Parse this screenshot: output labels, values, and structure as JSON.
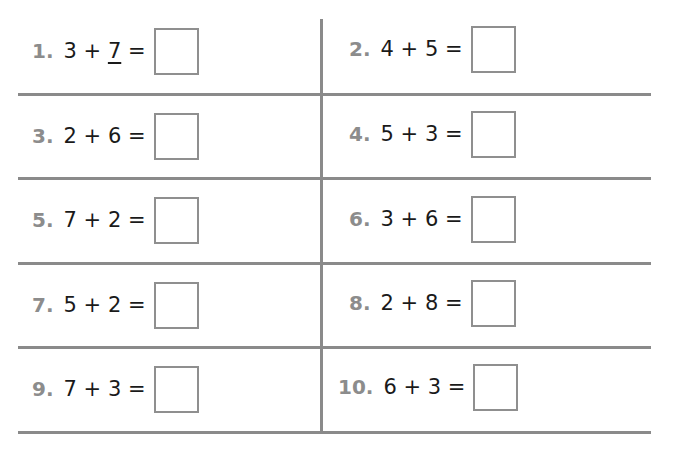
{
  "worksheet": {
    "problems": [
      {
        "number": "1.",
        "a": "3",
        "op": "+",
        "b": "7",
        "eq": "=",
        "b_underlined": true,
        "answer": ""
      },
      {
        "number": "2.",
        "a": "4",
        "op": "+",
        "b": "5",
        "eq": "=",
        "answer": ""
      },
      {
        "number": "3.",
        "a": "2",
        "op": "+",
        "b": "6",
        "eq": "=",
        "answer": ""
      },
      {
        "number": "4.",
        "a": "5",
        "op": "+",
        "b": "3",
        "eq": "=",
        "answer": ""
      },
      {
        "number": "5.",
        "a": "7",
        "op": "+",
        "b": "2",
        "eq": "=",
        "answer": ""
      },
      {
        "number": "6.",
        "a": "3",
        "op": "+",
        "b": "6",
        "eq": "=",
        "answer": ""
      },
      {
        "number": "7.",
        "a": "5",
        "op": "+",
        "b": "2",
        "eq": "=",
        "answer": ""
      },
      {
        "number": "8.",
        "a": "2",
        "op": "+",
        "b": "8",
        "eq": "=",
        "answer": ""
      },
      {
        "number": "9.",
        "a": "7",
        "op": "+",
        "b": "3",
        "eq": "=",
        "answer": ""
      },
      {
        "number": "10.",
        "a": "6",
        "op": "+",
        "b": "3",
        "eq": "=",
        "answer": ""
      }
    ],
    "colors": {
      "number": "#8c8c8c",
      "expression": "#1a1a1a",
      "rule_lines": "#8a8a8a",
      "box_border": "#8f8f8f"
    }
  }
}
